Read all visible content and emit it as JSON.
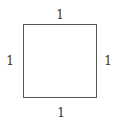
{
  "diagram": {
    "shape": "square",
    "stroke_color": "#555555",
    "labels": {
      "top": "1",
      "bottom": "1",
      "left": "1",
      "right": "1"
    }
  }
}
